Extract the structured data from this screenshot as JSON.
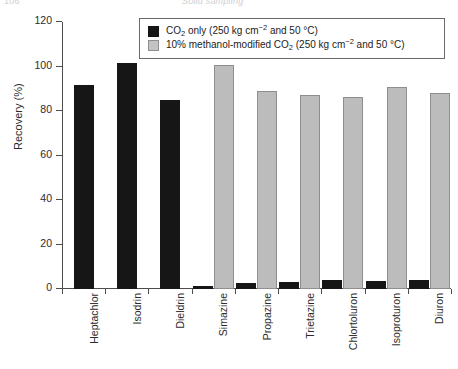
{
  "running_head": {
    "left": "106",
    "right": "Solid sampling"
  },
  "legend": {
    "series": [
      {
        "swatch": "dark",
        "color": "#161616",
        "label_parts": {
          "pre": "CO",
          "sub": "2",
          "mid": " only (250 kg cm",
          "sup": "−2",
          "post": " and 50 °C)"
        },
        "label": "CO2 only (250 kg cm-2 and 50 °C)"
      },
      {
        "swatch": "light",
        "color": "#bcbcbc",
        "label_parts": {
          "pre": "10% methanol-modified CO",
          "sub": "2",
          "mid": " (250 kg cm",
          "sup": "−2",
          "post": " and 50 °C)"
        },
        "label": "10% methanol-modified CO2 (250 kg cm-2 and 50 °C)"
      }
    ]
  },
  "axes": {
    "ylabel": "Recovery (%)",
    "yticks": [
      0,
      20,
      40,
      60,
      80,
      100,
      120
    ],
    "ytick_labels": [
      "0",
      "20",
      "40",
      "60",
      "80",
      "100",
      "120"
    ],
    "ylim": [
      0,
      120
    ],
    "xlabel": ""
  },
  "chart_data": {
    "type": "bar",
    "title": "",
    "xlabel": "",
    "ylabel": "Recovery (%)",
    "ylim": [
      0,
      120
    ],
    "grid": false,
    "legend_position": "top-center",
    "categories": [
      "Heptachlor",
      "Isodrin",
      "Dieldrin",
      "Simazine",
      "Propazine",
      "Trietazine",
      "Chlortoluron",
      "Isoproturon",
      "Diuron"
    ],
    "series": [
      {
        "name": "CO2 only (250 kg cm-2 and 50 °C)",
        "color": "#161616",
        "values": [
          91.5,
          101.5,
          85.0,
          1.5,
          2.5,
          3.0,
          4.0,
          3.5,
          4.0
        ]
      },
      {
        "name": "10% methanol-modified CO2 (250 kg cm-2 and 50 °C)",
        "color": "#bcbcbc",
        "values": [
          0,
          0,
          0,
          100.5,
          89.0,
          87.0,
          86.5,
          91.0,
          88.0
        ]
      }
    ]
  }
}
